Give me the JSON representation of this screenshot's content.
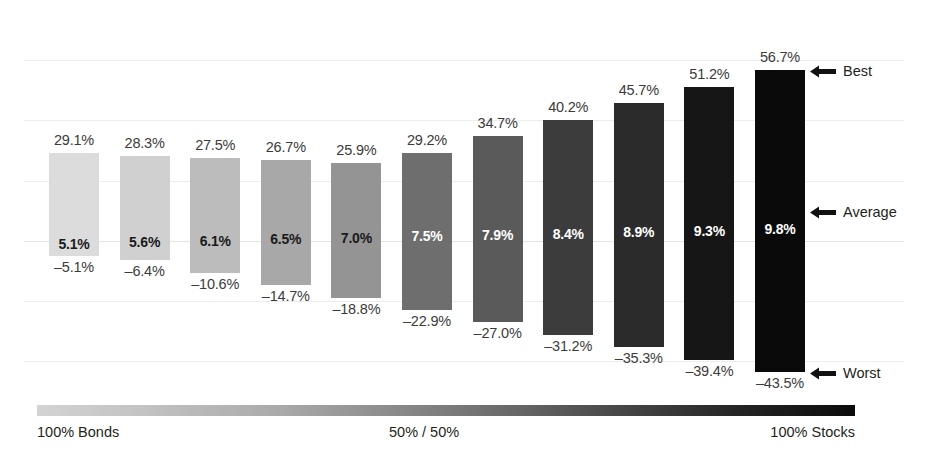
{
  "chart_data": {
    "type": "bar",
    "title": "",
    "subtitle": "",
    "xlabel": "",
    "ylabel": "",
    "grid": true,
    "legend_position": "right",
    "axis_caption_left": "100% Bonds",
    "axis_caption_mid": "50% / 50%",
    "axis_caption_right": "100% Stocks",
    "ylim": [
      -50,
      60
    ],
    "gridlines": [
      -40,
      -20,
      0,
      20,
      40,
      60
    ],
    "series": [
      {
        "name": "Best",
        "values": [
          29.1,
          28.3,
          27.5,
          26.7,
          25.9,
          29.2,
          34.7,
          40.2,
          45.7,
          51.2,
          56.7
        ]
      },
      {
        "name": "Average",
        "values": [
          5.1,
          5.6,
          6.1,
          6.5,
          7.0,
          7.5,
          7.9,
          8.4,
          8.9,
          9.3,
          9.8
        ]
      },
      {
        "name": "Worst",
        "values": [
          -5.1,
          -6.4,
          -10.6,
          -14.7,
          -18.8,
          -22.9,
          -27.0,
          -31.2,
          -35.3,
          -39.4,
          -43.5
        ]
      }
    ],
    "categories": [
      "100% Bonds",
      "90/10",
      "80/20",
      "70/30",
      "60/40",
      "50/50",
      "40/60",
      "30/70",
      "20/80",
      "10/90",
      "100% Stocks"
    ],
    "bars": [
      {
        "best": "29.1%",
        "average": "5.1%",
        "worst": "-5.1%",
        "color": "#dcdcdc",
        "avg_text_color": "#1a1a1a"
      },
      {
        "best": "28.3%",
        "average": "5.6%",
        "worst": "-6.4%",
        "color": "#d0d0d0",
        "avg_text_color": "#1a1a1a"
      },
      {
        "best": "27.5%",
        "average": "6.1%",
        "worst": "-10.6%",
        "color": "#bcbcbc",
        "avg_text_color": "#1a1a1a"
      },
      {
        "best": "26.7%",
        "average": "6.5%",
        "worst": "-14.7%",
        "color": "#a8a8a8",
        "avg_text_color": "#1a1a1a"
      },
      {
        "best": "25.9%",
        "average": "7.0%",
        "worst": "-18.8%",
        "color": "#949494",
        "avg_text_color": "#1a1a1a"
      },
      {
        "best": "29.2%",
        "average": "7.5%",
        "worst": "-22.9%",
        "color": "#6e6e6e",
        "avg_text_color": "#ffffff"
      },
      {
        "best": "34.7%",
        "average": "7.9%",
        "worst": "-27.0%",
        "color": "#5a5a5a",
        "avg_text_color": "#ffffff"
      },
      {
        "best": "40.2%",
        "average": "8.4%",
        "worst": "-31.2%",
        "color": "#3c3c3c",
        "avg_text_color": "#ffffff"
      },
      {
        "best": "45.7%",
        "average": "8.9%",
        "worst": "-35.3%",
        "color": "#2b2b2b",
        "avg_text_color": "#ffffff"
      },
      {
        "best": "51.2%",
        "average": "9.3%",
        "worst": "-39.4%",
        "color": "#161616",
        "avg_text_color": "#ffffff"
      },
      {
        "best": "56.7%",
        "average": "9.8%",
        "worst": "-43.5%",
        "color": "#0a0a0a",
        "avg_text_color": "#ffffff"
      }
    ],
    "annotations": [
      {
        "label": "Best",
        "value": 56.7
      },
      {
        "label": "Average",
        "value": 9.8
      },
      {
        "label": "Worst",
        "value": -43.5
      }
    ]
  }
}
